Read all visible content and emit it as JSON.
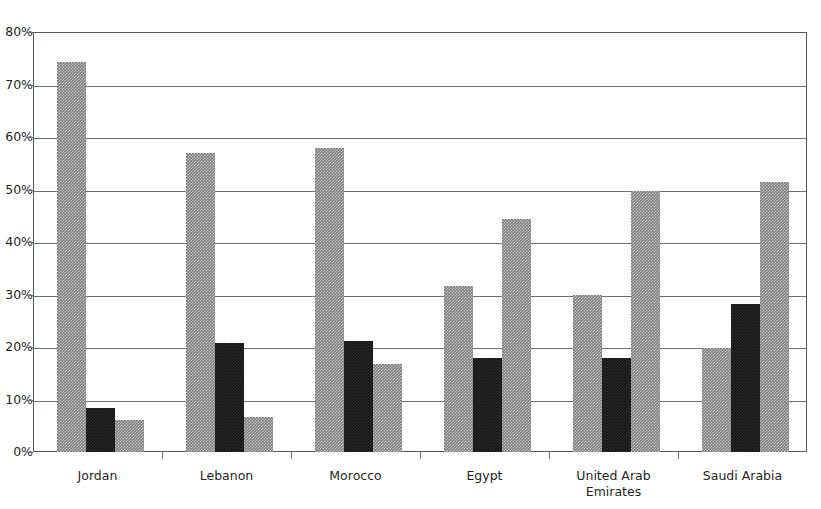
{
  "chart_data": {
    "type": "bar",
    "title": "",
    "subtitle": "",
    "xlabel": "",
    "ylabel": "",
    "ylim": [
      0,
      80
    ],
    "ytick_values": [
      0,
      10,
      20,
      30,
      40,
      50,
      60,
      70,
      80
    ],
    "ytick_labels": [
      "0%",
      "10%",
      "20%",
      "30%",
      "40%",
      "50%",
      "60%",
      "70%",
      "80%"
    ],
    "grid": "horizontal",
    "legend": "none",
    "legend_position": "none",
    "categories": [
      "Jordan",
      "Lebanon",
      "Morocco",
      "Egypt",
      "United Arab Emirates",
      "Saudi Arabia"
    ],
    "category_lines": [
      [
        "Jordan"
      ],
      [
        "Lebanon"
      ],
      [
        "Morocco"
      ],
      [
        "Egypt"
      ],
      [
        "United Arab",
        "Emirates"
      ],
      [
        "Saudi Arabia"
      ]
    ],
    "series": [
      {
        "name": "Series 1",
        "color": "#7b7b7b",
        "fill": "gray-hatched",
        "values": [
          74.2,
          57.0,
          58.0,
          31.6,
          30.0,
          19.8
        ]
      },
      {
        "name": "Series 2",
        "color": "#141414",
        "fill": "black-solid",
        "values": [
          8.4,
          20.8,
          21.1,
          18.0,
          18.0,
          28.1
        ]
      },
      {
        "name": "Series 3",
        "color": "#7b7b7b",
        "fill": "gray-hatched",
        "values": [
          6.1,
          6.7,
          16.7,
          44.3,
          49.8,
          51.4
        ]
      }
    ],
    "annotations": []
  },
  "colors": {
    "axis": "#58595b",
    "gridline": "#6d6e71",
    "text": "#231f20",
    "background": "#ffffff",
    "series_gray": "#7b7b7b",
    "series_black": "#141414"
  }
}
